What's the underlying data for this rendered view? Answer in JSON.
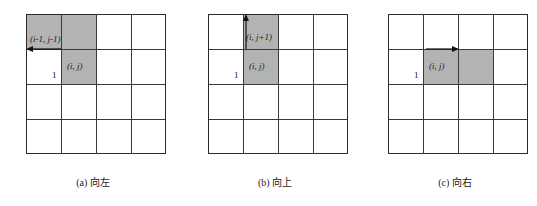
{
  "figure": {
    "colors": {
      "shade": "#b3b3b3",
      "grid_line": "#3a3a3a",
      "edge_line": "#2b2b2b",
      "text": "#1a1a1a",
      "background": "#ffffff"
    },
    "grid": {
      "rows": 4,
      "cols": 4
    }
  },
  "panels": [
    {
      "id": "a",
      "caption": "(a) 向左",
      "direction": "left",
      "arrow": {
        "name": "left-arrow",
        "description": "horizontal arrow pointing left"
      },
      "unit_label": "1",
      "labels": [
        {
          "name": "neighbor-cell-label",
          "text": "(i-1, j-1)"
        },
        {
          "name": "current-cell-label",
          "text": "(i, j)"
        }
      ]
    },
    {
      "id": "b",
      "caption": "(b) 向上",
      "direction": "up",
      "arrow": {
        "name": "up-arrow",
        "description": "vertical arrow pointing up"
      },
      "unit_label": "1",
      "labels": [
        {
          "name": "neighbor-cell-label",
          "text": "(i, j+1)"
        },
        {
          "name": "current-cell-label",
          "text": "(i, j)"
        }
      ]
    },
    {
      "id": "c",
      "caption": "(c) 向右",
      "direction": "right",
      "arrow": {
        "name": "right-arrow",
        "description": "horizontal arrow pointing right"
      },
      "unit_label": "1",
      "labels": [
        {
          "name": "current-cell-label",
          "text": "(i, j)"
        }
      ]
    }
  ]
}
